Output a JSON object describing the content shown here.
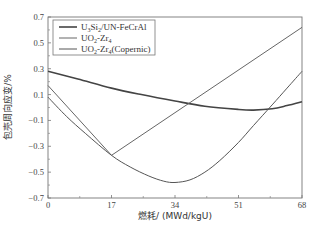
{
  "chart_data": {
    "type": "line",
    "title": "",
    "xlabel": "燃耗/ (MWd/kgU)",
    "ylabel": "包壳周向应变/%",
    "xlim": [
      0,
      68
    ],
    "ylim": [
      -0.7,
      0.7
    ],
    "xticks": [
      0,
      17,
      34,
      51,
      68
    ],
    "yticks": [
      0.7,
      0.5,
      0.3,
      0.1,
      -0.1,
      -0.3,
      -0.5,
      -0.7
    ],
    "xtick_labels": [
      "0",
      "17",
      "34",
      "51",
      "68"
    ],
    "ytick_labels": [
      "0.7",
      "0.5",
      "0.3",
      "0.1",
      "-0.1",
      "-0.3",
      "-0.5",
      "-0.7"
    ],
    "grid": false,
    "legend_position": "upper left",
    "series": [
      {
        "name": "U3Si2/UN-FeCrAl",
        "label_main": "U",
        "label_sub1": "3",
        "label_mid": "Si",
        "label_sub2": "2",
        "label_tail": "/UN-FeCrAl",
        "color": "#444444",
        "width": 1.6,
        "x": [
          0,
          8,
          17,
          25,
          34,
          42,
          51,
          55,
          60,
          64,
          68
        ],
        "y": [
          0.28,
          0.22,
          0.15,
          0.1,
          0.05,
          0.01,
          -0.015,
          -0.02,
          -0.01,
          0.015,
          0.045
        ]
      },
      {
        "name": "UO2-Zr4",
        "label_main": "UO",
        "label_sub1": "2",
        "label_mid": "-Zr",
        "label_sub2": "4",
        "label_tail": "",
        "color": "#666666",
        "width": 1.0,
        "x": [
          0,
          17,
          68
        ],
        "y": [
          0.17,
          -0.37,
          0.62
        ]
      },
      {
        "name": "UO2-Zr4(Copernic)",
        "label_main": "UO",
        "label_sub1": "2",
        "label_mid": "-Zr",
        "label_sub2": "4",
        "label_tail": "(Copernic)",
        "color": "#555555",
        "width": 1.0,
        "x": [
          0,
          5,
          10,
          17,
          22,
          27,
          31,
          34,
          38,
          42,
          46,
          51,
          55,
          60,
          64,
          68
        ],
        "y": [
          0.08,
          -0.07,
          -0.2,
          -0.37,
          -0.46,
          -0.53,
          -0.57,
          -0.58,
          -0.56,
          -0.5,
          -0.41,
          -0.27,
          -0.14,
          0.02,
          0.15,
          0.28
        ]
      }
    ]
  }
}
